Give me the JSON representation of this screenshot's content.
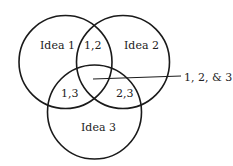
{
  "diagram": {
    "type": "venn",
    "circles": [
      {
        "id": "c1",
        "label": "Idea 1",
        "cx": 65.5,
        "cy": 62,
        "r": 46.5
      },
      {
        "id": "c2",
        "label": "Idea 2",
        "cx": 123,
        "cy": 62,
        "r": 46.5
      },
      {
        "id": "c3",
        "label": "Idea 3",
        "cx": 94.5,
        "cy": 112,
        "r": 47
      }
    ],
    "labels": {
      "idea1": "Idea 1",
      "idea2": "Idea 2",
      "idea3": "Idea 3",
      "overlap12": "1,2",
      "overlap13": "1,3",
      "overlap23": "2,3",
      "overlap123": "1, 2, & 3"
    },
    "stroke_color": "#1a1a1a"
  }
}
